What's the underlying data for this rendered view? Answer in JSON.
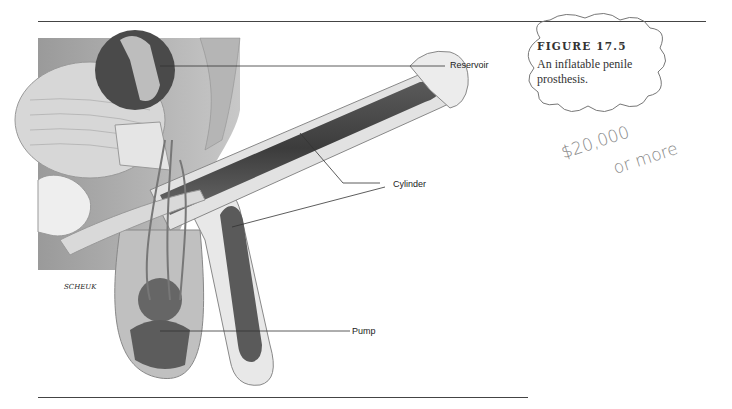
{
  "figure": {
    "number": "FIGURE 17.5",
    "caption": "An inflatable penile prosthesis."
  },
  "illustration": {
    "labels": {
      "reservoir": "Reservoir",
      "cylinder": "Cylinder",
      "pump": "Pump"
    },
    "artist_signature": "SCHEUK"
  },
  "handwritten_note": {
    "line1": "$20,000",
    "line2": "or more"
  },
  "colors": {
    "rule": "#444444",
    "annotation_ink": "#888888"
  }
}
